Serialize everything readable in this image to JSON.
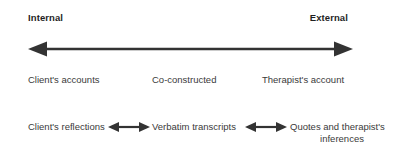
{
  "figure": {
    "title_poles": {
      "left": "Internal",
      "right": "External"
    },
    "main_axis": {
      "icon": "double-headed-arrow-icon",
      "direction": "bidirectional",
      "color": "#333333"
    },
    "row_continuum": {
      "left": "Client's accounts",
      "center": "Co-constructed",
      "right": "Therapist's account"
    },
    "row_examples": {
      "left": "Client's reflections",
      "center": "Verbatim transcripts",
      "right_line1": "Quotes and therapist's",
      "right_line2": "inferences",
      "connector_1": "double-headed-arrow-icon",
      "connector_2": "double-headed-arrow-icon"
    },
    "colors": {
      "background": "#ffffff",
      "text": "#3a3a3a",
      "bold_text": "#1f1f1f",
      "arrow": "#333333"
    }
  }
}
